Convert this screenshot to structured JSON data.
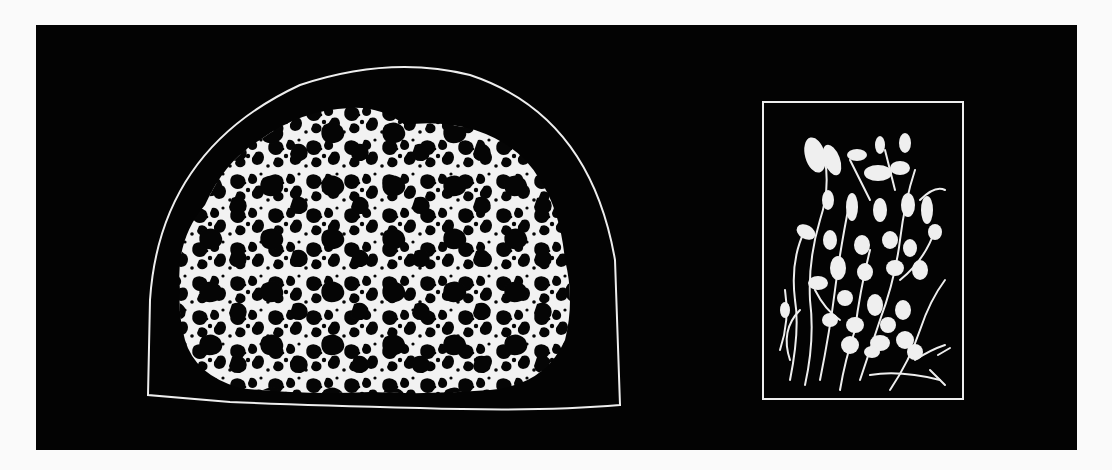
{
  "figure": {
    "colors": {
      "page_background": "#fafafa",
      "panel_background": "#030303",
      "drawing": "#f4f4f4"
    },
    "left_specimen": {
      "label": "porous-mass",
      "outline": "dome"
    },
    "right_specimen": {
      "label": "budding-cells-cluster",
      "outline": "rectangle-frame"
    }
  }
}
